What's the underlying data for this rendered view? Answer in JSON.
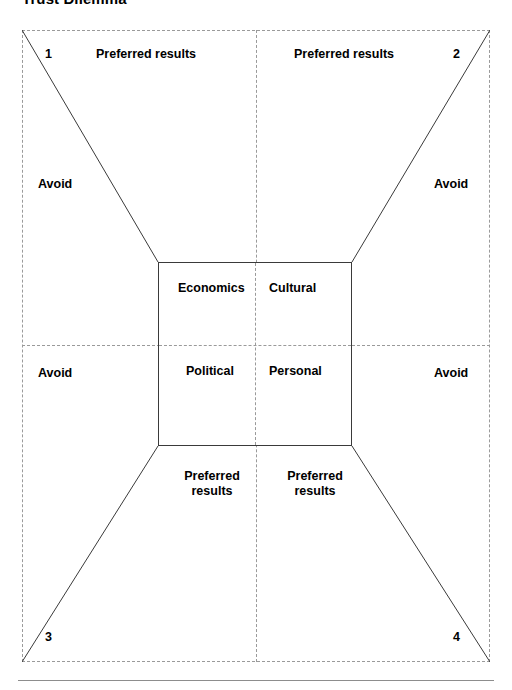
{
  "title": "Trust Dilemma",
  "diagram": {
    "type": "bowtie-quadrant-matrix",
    "corner_numbers": {
      "top_left": "1",
      "top_right": "2",
      "bottom_left": "3",
      "bottom_right": "4"
    },
    "center_box": {
      "quadrants": [
        {
          "key": "top_left",
          "label": "Economics"
        },
        {
          "key": "top_right",
          "label": "Cultural"
        },
        {
          "key": "bottom_left",
          "label": "Political"
        },
        {
          "key": "bottom_right",
          "label": "Personal"
        }
      ]
    },
    "outer_regions": {
      "preferred_top_left": "Preferred results",
      "preferred_top_right": "Preferred results",
      "avoid_left_upper": "Avoid",
      "avoid_right_upper": "Avoid",
      "avoid_left_lower": "Avoid",
      "avoid_right_lower": "Avoid",
      "preferred_bottom_left": "Preferred results",
      "preferred_bottom_right": "Preferred results"
    },
    "colors": {
      "dashed_line": "#9a9a9a",
      "solid_line": "#3a3a3a",
      "text": "#000000",
      "background": "#ffffff",
      "footer_rule": "#8d8d8d"
    }
  }
}
